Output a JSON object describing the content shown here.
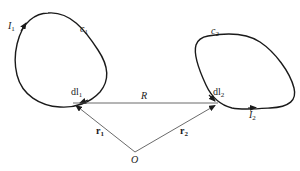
{
  "diagram": {
    "type": "two current loops with position vectors",
    "loops": [
      {
        "name": "c1",
        "curve_label": "c",
        "curve_sub": "1",
        "current_label": "I",
        "current_sub": "1",
        "element_label": "dl",
        "element_sub": "1"
      },
      {
        "name": "c2",
        "curve_label": "c",
        "curve_sub": "2",
        "current_label": "I",
        "current_sub": "2",
        "element_label": "dl",
        "element_sub": "2"
      }
    ],
    "separation_label": "R",
    "origin_label": "O",
    "vectors": [
      {
        "label": "r",
        "sub": "1"
      },
      {
        "label": "r",
        "sub": "2"
      }
    ],
    "colors": {
      "stroke": "#1a1a1a",
      "thin_stroke": "#444444",
      "background": "#ffffff"
    }
  }
}
